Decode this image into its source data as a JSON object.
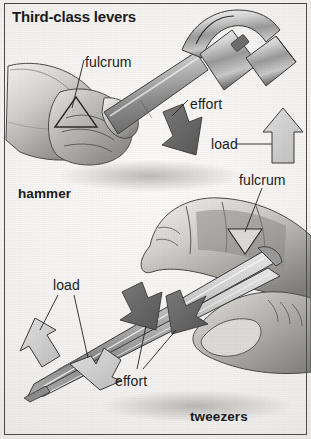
{
  "figure": {
    "title": "Third-class levers",
    "type": "illustration",
    "style": "grayscale scanned textbook diagram",
    "background_color": "#f2f1ef",
    "border_color": "#4a4a4a",
    "text_color": "#1b1b1b"
  },
  "panels": [
    {
      "id": "hammer",
      "caption": "hammer",
      "description": "A hand gripping a claw hammer swinging downward",
      "labels": [
        {
          "name": "fulcrum",
          "text": "fulcrum",
          "marker": "triangle-outline",
          "marker_color": "#8f8f8f"
        },
        {
          "name": "effort",
          "text": "effort",
          "marker": "arrow-down-right",
          "marker_color": "#6b6b6b"
        },
        {
          "name": "load",
          "text": "load",
          "marker": "arrow-up",
          "marker_color": "#cfcfcf"
        }
      ]
    },
    {
      "id": "tweezers",
      "caption": "tweezers",
      "description": "A hand holding a pair of tweezers between thumb and fingers",
      "labels": [
        {
          "name": "fulcrum",
          "text": "fulcrum",
          "marker": "triangle-down-filled",
          "marker_color": "#d4d4d4"
        },
        {
          "name": "effort",
          "text": "effort",
          "marker": "arrow-dark-pair",
          "marker_color": "#5e5e5e"
        },
        {
          "name": "load",
          "text": "load",
          "marker": "arrow-up-left",
          "marker_color": "#cfcfcf"
        }
      ]
    }
  ],
  "callouts": {
    "fulcrum_hammer": "fulcrum",
    "effort_hammer": "effort",
    "load_hammer": "load",
    "fulcrum_tweezers": "fulcrum",
    "load_tweezers": "load",
    "effort_tweezers": "effort"
  },
  "captions": {
    "hammer": "hammer",
    "tweezers": "tweezers"
  }
}
